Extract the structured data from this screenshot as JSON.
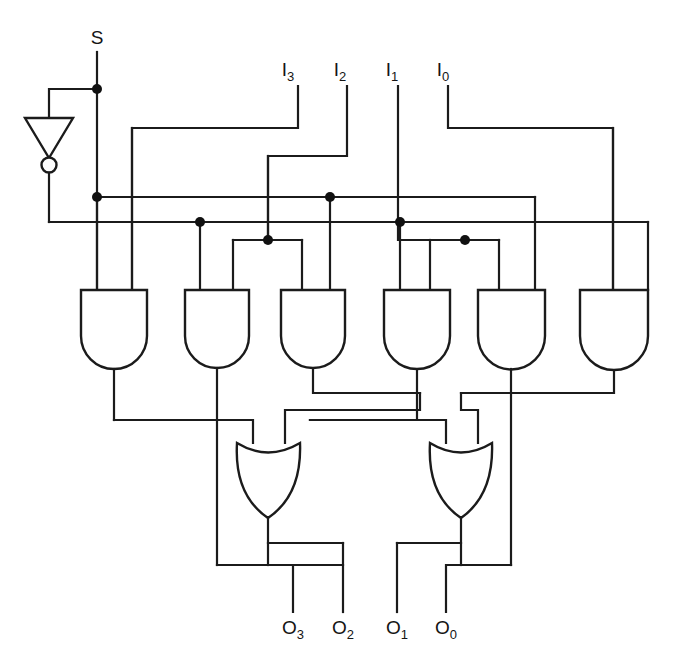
{
  "diagram": {
    "ink_color": "#1b1b1b",
    "background_color": "#ffffff"
  },
  "inputs": [
    {
      "id": "S",
      "base": "S",
      "sub": "",
      "x": 97,
      "label_y": 44
    },
    {
      "id": "I3",
      "base": "I",
      "sub": "3",
      "x": 288,
      "label_y": 76
    },
    {
      "id": "I2",
      "base": "I",
      "sub": "2",
      "x": 340,
      "label_y": 76
    },
    {
      "id": "I1",
      "base": "I",
      "sub": "1",
      "x": 392,
      "label_y": 76
    },
    {
      "id": "I0",
      "base": "I",
      "sub": "0",
      "x": 443,
      "label_y": 76
    }
  ],
  "outputs": [
    {
      "id": "O3",
      "base": "O",
      "sub": "3",
      "x": 293,
      "label_y": 634
    },
    {
      "id": "O2",
      "base": "O",
      "sub": "2",
      "x": 343,
      "label_y": 634
    },
    {
      "id": "O1",
      "base": "O",
      "sub": "1",
      "x": 397,
      "label_y": 634
    },
    {
      "id": "O0",
      "base": "O",
      "sub": "0",
      "x": 446,
      "label_y": 634
    }
  ],
  "gates": {
    "not": [
      {
        "id": "NOT1",
        "type": "inverter",
        "x": 49,
        "y": 118,
        "label": "S inverter"
      }
    ],
    "and": [
      {
        "id": "AND1",
        "type": "and",
        "x": 81,
        "label": "AND gate 1"
      },
      {
        "id": "AND2",
        "type": "and",
        "x": 185,
        "label": "AND gate 2"
      },
      {
        "id": "AND3",
        "type": "and",
        "x": 281,
        "label": "AND gate 3"
      },
      {
        "id": "AND4",
        "type": "and",
        "x": 384,
        "label": "AND gate 4"
      },
      {
        "id": "AND5",
        "type": "and",
        "x": 478,
        "label": "AND gate 5"
      },
      {
        "id": "AND6",
        "type": "and",
        "x": 580,
        "label": "AND gate 6"
      }
    ],
    "or": [
      {
        "id": "OR1",
        "type": "or",
        "x": 237,
        "label": "OR gate 1"
      },
      {
        "id": "OR2",
        "type": "or",
        "x": 430,
        "label": "OR gate 2"
      }
    ]
  },
  "buses": [
    {
      "id": "S-bus",
      "y": 197,
      "label": "S select bus"
    },
    {
      "id": "Sbar-bus",
      "y": 222,
      "label": "S-inverted select bus"
    }
  ],
  "junctions": [
    {
      "x": 97,
      "y": 89
    },
    {
      "x": 97,
      "y": 197
    },
    {
      "x": 330,
      "y": 197
    },
    {
      "x": 200,
      "y": 222
    },
    {
      "x": 400,
      "y": 222
    },
    {
      "x": 268,
      "y": 240
    },
    {
      "x": 465,
      "y": 240
    }
  ]
}
